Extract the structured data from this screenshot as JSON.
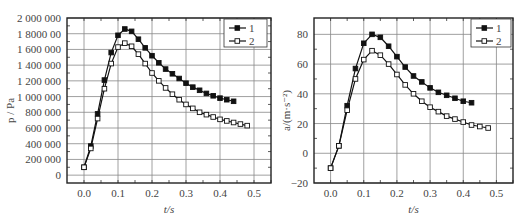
{
  "chart_data": [
    {
      "type": "line",
      "title": "",
      "xlabel": "t/s",
      "ylabel": "p / Pa",
      "xlim": [
        -0.05,
        0.55
      ],
      "ylim": [
        -100000,
        2000000
      ],
      "grid": true,
      "legend_position": "upper right",
      "x_ticks": [
        "0.0",
        "0.1",
        "0.2",
        "0.3",
        "0.4",
        "0.5"
      ],
      "y_ticks": [
        "0",
        "200 000",
        "400 000",
        "600 000",
        "800 000",
        "1 000 000",
        "1 200 000",
        "1 400 000",
        "1 600 000",
        "1 8000 00",
        "2 000 000"
      ],
      "series": [
        {
          "name": "1",
          "marker": "filled-square",
          "x": [
            0.0,
            0.02,
            0.04,
            0.06,
            0.08,
            0.1,
            0.12,
            0.14,
            0.16,
            0.18,
            0.2,
            0.22,
            0.24,
            0.26,
            0.28,
            0.3,
            0.32,
            0.34,
            0.36,
            0.38,
            0.4,
            0.42,
            0.44
          ],
          "y": [
            100000,
            370000,
            780000,
            1210000,
            1560000,
            1780000,
            1860000,
            1830000,
            1730000,
            1620000,
            1520000,
            1430000,
            1350000,
            1290000,
            1230000,
            1170000,
            1120000,
            1080000,
            1040000,
            1010000,
            980000,
            960000,
            940000
          ]
        },
        {
          "name": "2",
          "marker": "open-square",
          "x": [
            0.0,
            0.02,
            0.04,
            0.06,
            0.08,
            0.1,
            0.12,
            0.14,
            0.16,
            0.18,
            0.2,
            0.22,
            0.24,
            0.26,
            0.28,
            0.3,
            0.32,
            0.34,
            0.36,
            0.38,
            0.4,
            0.42,
            0.44,
            0.46,
            0.48
          ],
          "y": [
            100000,
            340000,
            720000,
            1100000,
            1420000,
            1630000,
            1680000,
            1640000,
            1540000,
            1420000,
            1300000,
            1200000,
            1110000,
            1030000,
            960000,
            900000,
            850000,
            800000,
            770000,
            740000,
            710000,
            690000,
            670000,
            650000,
            630000
          ]
        }
      ]
    },
    {
      "type": "line",
      "title": "",
      "xlabel": "t/s",
      "ylabel": "a/(m·s⁻²)",
      "xlim": [
        -0.05,
        0.55
      ],
      "ylim": [
        -20,
        91
      ],
      "grid": true,
      "legend_position": "upper right",
      "x_ticks": [
        "0.0",
        "0.1",
        "0.2",
        "0.3",
        "0.4",
        "0.5"
      ],
      "y_ticks": [
        "−20",
        "0",
        "20",
        "40",
        "60",
        "80"
      ],
      "series": [
        {
          "name": "1",
          "marker": "filled-square",
          "x": [
            0.0,
            0.025,
            0.05,
            0.075,
            0.1,
            0.125,
            0.15,
            0.175,
            0.2,
            0.225,
            0.25,
            0.275,
            0.3,
            0.325,
            0.35,
            0.375,
            0.4,
            0.425
          ],
          "y": [
            -10,
            5,
            32,
            57,
            74,
            80,
            78,
            72,
            65,
            58,
            52,
            48,
            44,
            41,
            39,
            37,
            35,
            34
          ]
        },
        {
          "name": "2",
          "marker": "open-square",
          "x": [
            0.0,
            0.025,
            0.05,
            0.075,
            0.1,
            0.125,
            0.15,
            0.175,
            0.2,
            0.225,
            0.25,
            0.275,
            0.3,
            0.325,
            0.35,
            0.375,
            0.4,
            0.425,
            0.45,
            0.475
          ],
          "y": [
            -10,
            5,
            29,
            50,
            63,
            69,
            66,
            60,
            53,
            46,
            40,
            35,
            31,
            28,
            25,
            23,
            21,
            19,
            18,
            17
          ]
        }
      ]
    }
  ],
  "legend": {
    "labels": [
      "1",
      "2"
    ]
  }
}
